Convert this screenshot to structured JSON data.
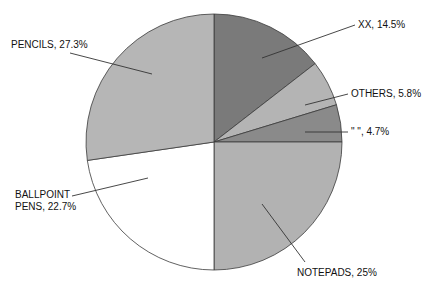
{
  "chart_data": {
    "type": "pie",
    "title": "",
    "start": "12 o'clock",
    "direction": "clockwise",
    "slices": [
      {
        "label": "XX",
        "value": 14.5,
        "display": "XX, 14.5%",
        "color": "#7a7a7a"
      },
      {
        "label": "OTHERS",
        "value": 5.8,
        "display": "OTHERS, 5.8%",
        "color": "#b4b4b4"
      },
      {
        "label": "\" \"",
        "value": 4.7,
        "display": "\" \", 4.7%",
        "color": "#8a8a8a"
      },
      {
        "label": "NOTEPADS",
        "value": 25,
        "display": "NOTEPADS, 25%",
        "color": "#b2b2b2"
      },
      {
        "label": "BALLPOINT PENS",
        "value": 22.7,
        "display_lines": [
          "BALLPOINT",
          "PENS, 22.7%"
        ],
        "display": "BALLPOINT PENS, 22.7%",
        "color": "#ffffff"
      },
      {
        "label": "PENCILS",
        "value": 27.3,
        "display": "PENCILS, 27.3%",
        "color": "#b6b6b6"
      }
    ],
    "legend": "none",
    "data_labels": "outside with leader lines"
  }
}
